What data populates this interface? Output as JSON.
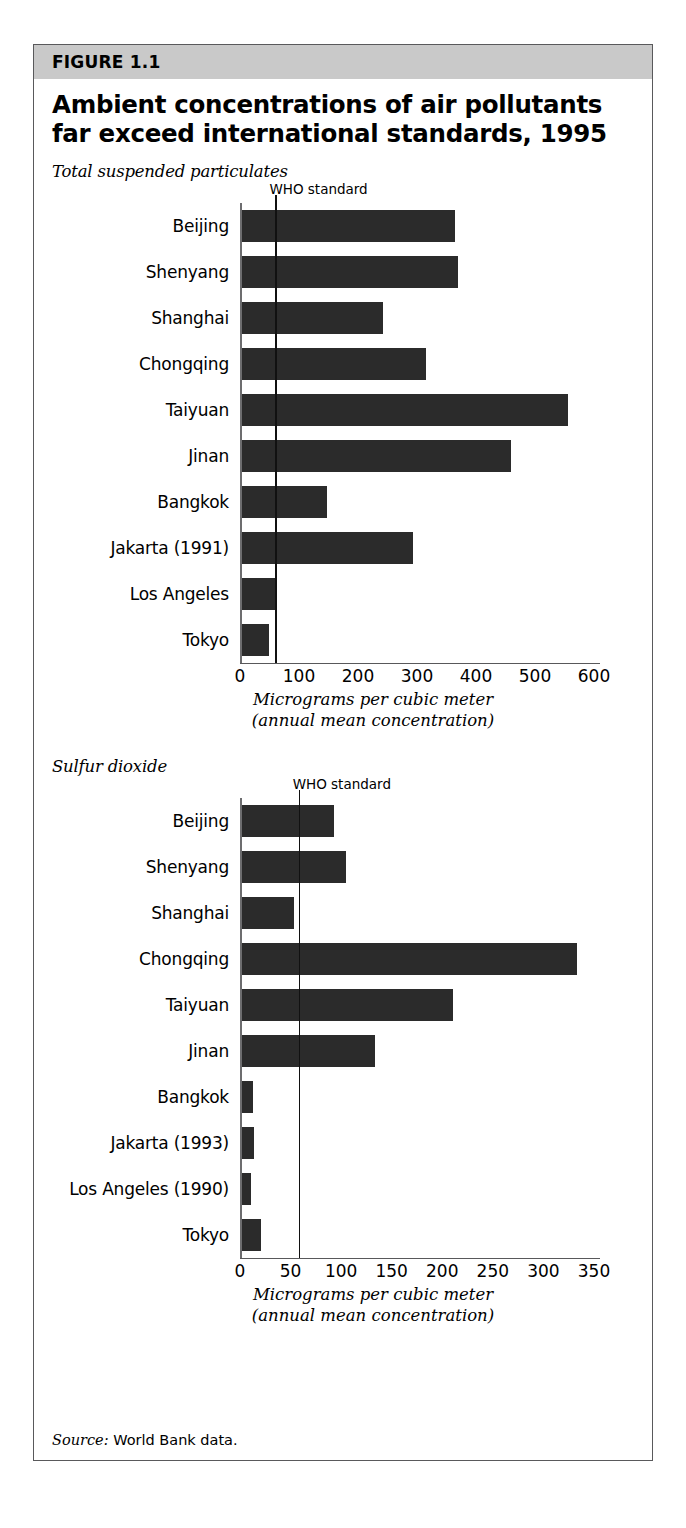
{
  "figure": {
    "number_label": "FIGURE 1.1",
    "title_line1": "Ambient concentrations of air pollutants",
    "title_line2": "far exceed international standards, 1995",
    "source_prefix": "Source:",
    "source_text": "World Bank data.",
    "band_color": "#c9c9c9",
    "bar_color": "#2b2b2b",
    "border_color": "#59595b"
  },
  "chart_data": [
    {
      "type": "bar",
      "orientation": "horizontal",
      "title": "Total suspended particulates",
      "xlabel_line1": "Micrograms per cubic meter",
      "xlabel_line2": "(annual mean concentration)",
      "ylabel": "",
      "categories": [
        "Beijing",
        "Shenyang",
        "Shanghai",
        "Chongqing",
        "Taiyuan",
        "Jinan",
        "Bangkok",
        "Jakarta (1991)",
        "Los Angeles",
        "Tokyo"
      ],
      "values": [
        365,
        370,
        242,
        315,
        556,
        460,
        148,
        293,
        61,
        49
      ],
      "xlim": [
        0,
        600
      ],
      "xticks": [
        0,
        100,
        200,
        300,
        400,
        500,
        600
      ],
      "xtick_labels": [
        "0",
        "100",
        "200",
        "300",
        "400",
        "500",
        "600"
      ],
      "grid": false,
      "reference_line": {
        "label": "WHO standard",
        "value": 60
      }
    },
    {
      "type": "bar",
      "orientation": "horizontal",
      "title": "Sulfur dioxide",
      "xlabel_line1": "Micrograms per cubic meter",
      "xlabel_line2": "(annual mean concentration)",
      "ylabel": "",
      "categories": [
        "Beijing",
        "Shenyang",
        "Shanghai",
        "Chongqing",
        "Taiyuan",
        "Jinan",
        "Bangkok",
        "Jakarta (1993)",
        "Los Angeles (1990)",
        "Tokyo"
      ],
      "values": [
        93,
        105,
        53,
        333,
        211,
        133,
        13,
        14,
        11,
        21
      ],
      "xlim": [
        0,
        350
      ],
      "xticks": [
        0,
        50,
        100,
        150,
        200,
        250,
        300,
        350
      ],
      "xtick_labels": [
        "0",
        "50",
        "100",
        "150",
        "200",
        "250",
        "300",
        "350"
      ],
      "grid": false,
      "reference_line": {
        "label": "WHO standard",
        "value": 58
      }
    }
  ]
}
